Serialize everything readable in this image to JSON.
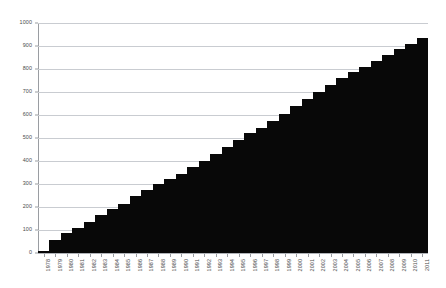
{
  "chart_data": {
    "type": "bar",
    "title": "",
    "subtitle": "",
    "xlabel": "",
    "ylabel": "",
    "ylim": [
      0,
      1000
    ],
    "ytick_step": 100,
    "yticks": [
      0,
      100,
      200,
      300,
      400,
      500,
      600,
      700,
      800,
      900,
      1000
    ],
    "grid": true,
    "legend": "none",
    "bar_color": "#080808",
    "grid_color": "#c9ccd1",
    "axis_color": "#9a9da2",
    "bar_gap": 0,
    "categories": [
      "1978",
      "1979",
      "1980",
      "1981",
      "1982",
      "1983",
      "1984",
      "1985",
      "1986",
      "1987",
      "1988",
      "1989",
      "1990",
      "1991",
      "1992",
      "1993",
      "1994",
      "1995",
      "1996",
      "1997",
      "1998",
      "1999",
      "2000",
      "2001",
      "2002",
      "2003",
      "2004",
      "2005",
      "2006",
      "2007",
      "2008",
      "2009",
      "2010",
      "2011"
    ],
    "values": [
      10,
      55,
      85,
      110,
      135,
      165,
      190,
      215,
      250,
      275,
      300,
      320,
      345,
      375,
      400,
      430,
      460,
      490,
      520,
      545,
      575,
      605,
      640,
      670,
      700,
      730,
      760,
      785,
      810,
      835,
      860,
      885,
      910,
      935
    ]
  }
}
